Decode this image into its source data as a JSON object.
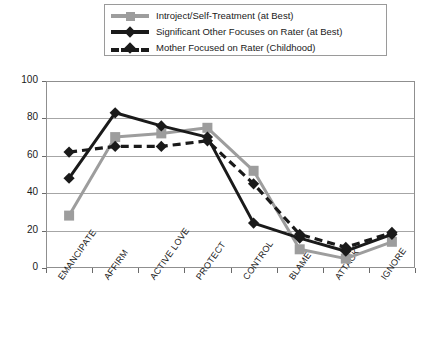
{
  "legend": {
    "position": "top-center",
    "items": [
      {
        "label": "Introject/Self-Treatment (at Best)",
        "marker": "square-marker-icon",
        "line": "solid",
        "color": "#9d9d9d"
      },
      {
        "label": "Significant Other Focuses on Rater (at Best)",
        "marker": "diamond-marker-icon",
        "line": "solid",
        "color": "#1a1a1a"
      },
      {
        "label": "Mother Focused on Rater (Childhood)",
        "marker": "diamond-marker-icon",
        "line": "dashed",
        "color": "#1a1a1a"
      }
    ]
  },
  "axis": {
    "y_ticks": [
      "0",
      "20",
      "40",
      "60",
      "80",
      "100"
    ],
    "x_ticks": [
      "EMANCIPATE",
      "AFFIRM",
      "ACTIVE LOVE",
      "PROTECT",
      "CONTROL",
      "BLAME",
      "ATTACK",
      "IGNORE"
    ]
  },
  "chart_data": {
    "type": "line",
    "title": "",
    "xlabel": "",
    "ylabel": "",
    "ylim": [
      0,
      100
    ],
    "ytick_step": 20,
    "grid": true,
    "legend_position": "top-center",
    "categories": [
      "EMANCIPATE",
      "AFFIRM",
      "ACTIVE LOVE",
      "PROTECT",
      "CONTROL",
      "BLAME",
      "ATTACK",
      "IGNORE"
    ],
    "series": [
      {
        "name": "Introject/Self-Treatment (at Best)",
        "color": "#9d9d9d",
        "line_style": "solid",
        "marker": "square",
        "values": [
          28,
          70,
          72,
          75,
          52,
          10,
          5,
          14
        ]
      },
      {
        "name": "Significant Other Focuses on Rater (at Best)",
        "color": "#1a1a1a",
        "line_style": "solid",
        "marker": "diamond",
        "values": [
          48,
          83,
          76,
          70,
          24,
          16,
          9,
          18
        ]
      },
      {
        "name": "Mother Focused on Rater (Childhood)",
        "color": "#1a1a1a",
        "line_style": "dashed",
        "marker": "diamond",
        "values": [
          62,
          65,
          65,
          68,
          45,
          18,
          11,
          19
        ]
      }
    ]
  }
}
